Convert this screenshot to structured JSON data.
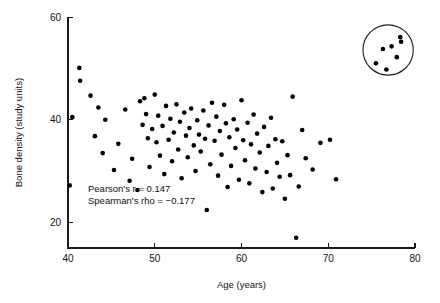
{
  "chart_data": {
    "type": "scatter",
    "title": "",
    "xlabel": "Age (years)",
    "ylabel": "Bone density (study units)",
    "xlim": [
      40,
      80
    ],
    "ylim": [
      15,
      61
    ],
    "grid": false,
    "legend": "none",
    "xticks": [
      40,
      50,
      60,
      70,
      80
    ],
    "xtick_labels": [
      "40",
      "50",
      "60",
      "70",
      "80"
    ],
    "yticks": [
      20,
      40,
      60
    ],
    "ytick_labels": [
      "20",
      "40",
      "60"
    ],
    "annotations": [
      "Pearson's r = 0.147",
      "Spearman's rho = −0.177"
    ],
    "statistics": {
      "pearson_r_label": "Pearson's r",
      "pearson_r_value": 0.147,
      "spearman_rho_label": "Spearman's rho",
      "spearman_rho_value": -0.177
    },
    "highlight": {
      "shape": "circle",
      "label": "outlier-cluster",
      "center_x": 76.9,
      "center_y": 53.6,
      "radius_x": 2.9,
      "radius_y": 4.9,
      "n_points": 7
    },
    "series": [
      {
        "name": "Subjects",
        "marker": "filled-circle",
        "color": "#000000",
        "points": [
          [
            40.2,
            27.2
          ],
          [
            40.5,
            40.5
          ],
          [
            41.3,
            50.1
          ],
          [
            41.4,
            47.6
          ],
          [
            42.6,
            44.7
          ],
          [
            43.1,
            36.8
          ],
          [
            43.5,
            42.4
          ],
          [
            44.0,
            33.5
          ],
          [
            44.3,
            40.0
          ],
          [
            45.3,
            30.2
          ],
          [
            45.8,
            35.3
          ],
          [
            46.6,
            42.0
          ],
          [
            47.1,
            28.1
          ],
          [
            47.4,
            32.4
          ],
          [
            48.0,
            26.3
          ],
          [
            48.3,
            43.6
          ],
          [
            48.6,
            39.0
          ],
          [
            48.8,
            44.2
          ],
          [
            49.0,
            41.1
          ],
          [
            49.2,
            36.4
          ],
          [
            49.4,
            30.8
          ],
          [
            49.7,
            38.2
          ],
          [
            50.0,
            44.9
          ],
          [
            50.2,
            35.6
          ],
          [
            50.4,
            40.8
          ],
          [
            50.6,
            33.0
          ],
          [
            50.9,
            38.8
          ],
          [
            51.1,
            29.4
          ],
          [
            51.3,
            42.7
          ],
          [
            51.6,
            36.1
          ],
          [
            51.8,
            40.2
          ],
          [
            52.0,
            31.9
          ],
          [
            52.2,
            37.5
          ],
          [
            52.5,
            43.0
          ],
          [
            52.7,
            34.2
          ],
          [
            52.9,
            39.6
          ],
          [
            53.1,
            28.6
          ],
          [
            53.4,
            41.4
          ],
          [
            53.6,
            36.9
          ],
          [
            53.8,
            32.7
          ],
          [
            54.0,
            38.4
          ],
          [
            54.2,
            42.2
          ],
          [
            54.5,
            35.0
          ],
          [
            54.7,
            30.0
          ],
          [
            54.9,
            39.9
          ],
          [
            55.1,
            37.1
          ],
          [
            55.3,
            33.8
          ],
          [
            55.6,
            41.8
          ],
          [
            55.8,
            36.3
          ],
          [
            56.0,
            22.4
          ],
          [
            56.2,
            38.9
          ],
          [
            56.4,
            31.3
          ],
          [
            56.6,
            43.3
          ],
          [
            56.9,
            35.9
          ],
          [
            57.1,
            40.6
          ],
          [
            57.3,
            29.1
          ],
          [
            57.5,
            37.8
          ],
          [
            57.7,
            33.2
          ],
          [
            58.0,
            42.9
          ],
          [
            58.2,
            39.3
          ],
          [
            58.4,
            26.9
          ],
          [
            58.6,
            36.6
          ],
          [
            58.8,
            31.0
          ],
          [
            59.1,
            40.1
          ],
          [
            59.3,
            34.5
          ],
          [
            59.5,
            38.1
          ],
          [
            59.7,
            28.3
          ],
          [
            60.0,
            43.8
          ],
          [
            60.2,
            36.0
          ],
          [
            60.4,
            32.1
          ],
          [
            60.7,
            39.4
          ],
          [
            60.9,
            27.6
          ],
          [
            61.1,
            35.2
          ],
          [
            61.4,
            41.0
          ],
          [
            61.6,
            30.5
          ],
          [
            61.8,
            37.3
          ],
          [
            62.1,
            33.6
          ],
          [
            62.4,
            25.9
          ],
          [
            62.6,
            38.6
          ],
          [
            62.9,
            29.8
          ],
          [
            63.1,
            34.9
          ],
          [
            63.4,
            40.4
          ],
          [
            63.6,
            26.6
          ],
          [
            63.9,
            36.2
          ],
          [
            64.1,
            31.6
          ],
          [
            64.4,
            28.9
          ],
          [
            64.7,
            35.8
          ],
          [
            65.0,
            24.6
          ],
          [
            65.3,
            33.1
          ],
          [
            65.6,
            29.2
          ],
          [
            65.9,
            44.5
          ],
          [
            66.3,
            17.0
          ],
          [
            66.6,
            27.0
          ],
          [
            67.0,
            38.0
          ],
          [
            67.4,
            32.5
          ],
          [
            68.2,
            30.3
          ],
          [
            69.1,
            35.5
          ],
          [
            70.2,
            36.1
          ],
          [
            70.9,
            28.4
          ],
          [
            75.5,
            51.0
          ],
          [
            76.3,
            53.8
          ],
          [
            76.7,
            49.8
          ],
          [
            77.3,
            54.3
          ],
          [
            77.9,
            52.2
          ],
          [
            78.3,
            56.1
          ],
          [
            78.4,
            55.2
          ]
        ]
      }
    ]
  }
}
